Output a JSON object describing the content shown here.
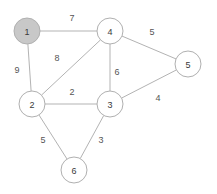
{
  "graph": {
    "title": "Weighted undirected graph",
    "style": {
      "background": "#ffffff",
      "node_fill_default": "#ffffff",
      "node_fill_highlight": "#c8c8c8",
      "node_stroke": "#b0b0b0",
      "edge_stroke": "#b3b3b3",
      "label_color": "#3a3a3a",
      "weight_color": "#555555",
      "node_radius": 13
    },
    "nodes": [
      {
        "id": "1",
        "label": "1",
        "x": 27,
        "y": 31,
        "r": 13,
        "highlighted": true,
        "fill": "#c8c8c8"
      },
      {
        "id": "2",
        "label": "2",
        "x": 32,
        "y": 104,
        "r": 13,
        "highlighted": false,
        "fill": "#ffffff"
      },
      {
        "id": "3",
        "label": "3",
        "x": 110,
        "y": 104,
        "r": 13,
        "highlighted": false,
        "fill": "#ffffff"
      },
      {
        "id": "4",
        "label": "4",
        "x": 110,
        "y": 31,
        "r": 13,
        "highlighted": false,
        "fill": "#ffffff"
      },
      {
        "id": "5",
        "label": "5",
        "x": 188,
        "y": 64,
        "r": 13,
        "highlighted": false,
        "fill": "#ffffff"
      },
      {
        "id": "6",
        "label": "6",
        "x": 74,
        "y": 170,
        "r": 13,
        "highlighted": false,
        "fill": "#ffffff"
      }
    ],
    "edges": [
      {
        "id": "e-1-4",
        "source": "1",
        "target": "4",
        "weight": "7",
        "label_x": 72,
        "label_y": 18
      },
      {
        "id": "e-1-2",
        "source": "1",
        "target": "2",
        "weight": "9",
        "label_x": 17,
        "label_y": 70
      },
      {
        "id": "e-2-4",
        "source": "2",
        "target": "4",
        "weight": "8",
        "label_x": 57,
        "label_y": 58
      },
      {
        "id": "e-2-3",
        "source": "2",
        "target": "3",
        "weight": "2",
        "label_x": 72,
        "label_y": 92
      },
      {
        "id": "e-3-4",
        "source": "3",
        "target": "4",
        "weight": "6",
        "label_x": 117,
        "label_y": 72
      },
      {
        "id": "e-4-5",
        "source": "4",
        "target": "5",
        "weight": "5",
        "label_x": 152,
        "label_y": 32
      },
      {
        "id": "e-3-5",
        "source": "3",
        "target": "5",
        "weight": "4",
        "label_x": 158,
        "label_y": 98
      },
      {
        "id": "e-2-6",
        "source": "2",
        "target": "6",
        "weight": "5",
        "label_x": 43,
        "label_y": 140
      },
      {
        "id": "e-3-6",
        "source": "3",
        "target": "6",
        "weight": "3",
        "label_x": 101,
        "label_y": 140
      }
    ]
  }
}
